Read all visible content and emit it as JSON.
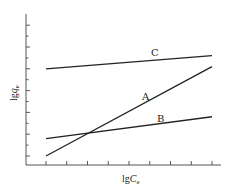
{
  "chart_data": {
    "type": "line",
    "title": "",
    "xlabel": "lgC_e",
    "ylabel": "lgq_e",
    "xlabel_parts": {
      "base": "lg",
      "var": "C",
      "sub": "e"
    },
    "ylabel_parts": {
      "base": "lg",
      "var": "q",
      "sub": "e"
    },
    "x_ticks_count": 9,
    "y_major_ticks_count": 7,
    "y_minor_ticks_between": true,
    "tick_labels_shown": false,
    "grid": false,
    "legend": "inline labels",
    "xlim": [
      0,
      10
    ],
    "ylim": [
      0,
      7.4
    ],
    "series": [
      {
        "name": "C",
        "x": [
          1,
          9
        ],
        "y": [
          5.0,
          5.6
        ],
        "label_pos": {
          "x": 6.4,
          "y": 5.7
        }
      },
      {
        "name": "A",
        "x": [
          1,
          9
        ],
        "y": [
          1.0,
          5.1
        ],
        "label_pos": {
          "x": 5.9,
          "y": 3.7
        }
      },
      {
        "name": "B",
        "x": [
          1,
          9
        ],
        "y": [
          1.8,
          2.8
        ],
        "label_pos": {
          "x": 6.6,
          "y": 2.8
        }
      }
    ],
    "annotations": [
      "A",
      "B",
      "C"
    ]
  },
  "labels": {
    "series_c": "C",
    "series_a": "A",
    "series_b": "B",
    "x_base": "lg",
    "x_var": "C",
    "x_sub": "e",
    "y_base": "lg",
    "y_var": "q",
    "y_sub": "e"
  }
}
